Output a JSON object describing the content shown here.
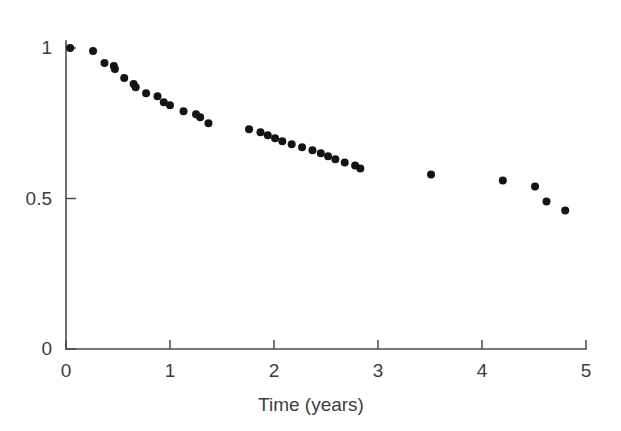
{
  "chart_data": {
    "type": "scatter",
    "title": "",
    "subtitle": "",
    "xlabel": "Time (years)",
    "ylabel": "",
    "xlim": [
      0,
      5
    ],
    "ylim": [
      0,
      1
    ],
    "xticks": [
      0,
      1,
      2,
      3,
      4,
      5
    ],
    "xticklabels": [
      "0",
      "1",
      "2",
      "3",
      "4",
      "5"
    ],
    "yticks": [
      0,
      0.5,
      1
    ],
    "yticklabels": [
      "0",
      "0.5",
      "1"
    ],
    "grid": false,
    "legend": null,
    "marker": "filled-circle",
    "marker_color": "#141414",
    "marker_size": 4,
    "series": [
      {
        "name": "survival",
        "points": [
          {
            "x": 0.04,
            "y": 1.0
          },
          {
            "x": 0.26,
            "y": 0.99
          },
          {
            "x": 0.37,
            "y": 0.95
          },
          {
            "x": 0.46,
            "y": 0.94
          },
          {
            "x": 0.47,
            "y": 0.93
          },
          {
            "x": 0.56,
            "y": 0.9
          },
          {
            "x": 0.65,
            "y": 0.88
          },
          {
            "x": 0.67,
            "y": 0.87
          },
          {
            "x": 0.77,
            "y": 0.85
          },
          {
            "x": 0.88,
            "y": 0.84
          },
          {
            "x": 0.94,
            "y": 0.82
          },
          {
            "x": 1.0,
            "y": 0.81
          },
          {
            "x": 1.13,
            "y": 0.79
          },
          {
            "x": 1.25,
            "y": 0.78
          },
          {
            "x": 1.29,
            "y": 0.77
          },
          {
            "x": 1.37,
            "y": 0.75
          },
          {
            "x": 1.76,
            "y": 0.73
          },
          {
            "x": 1.87,
            "y": 0.72
          },
          {
            "x": 1.94,
            "y": 0.71
          },
          {
            "x": 2.01,
            "y": 0.7
          },
          {
            "x": 2.08,
            "y": 0.69
          },
          {
            "x": 2.17,
            "y": 0.68
          },
          {
            "x": 2.27,
            "y": 0.67
          },
          {
            "x": 2.37,
            "y": 0.66
          },
          {
            "x": 2.45,
            "y": 0.65
          },
          {
            "x": 2.52,
            "y": 0.64
          },
          {
            "x": 2.59,
            "y": 0.63
          },
          {
            "x": 2.68,
            "y": 0.62
          },
          {
            "x": 2.78,
            "y": 0.61
          },
          {
            "x": 2.83,
            "y": 0.6
          },
          {
            "x": 3.51,
            "y": 0.58
          },
          {
            "x": 4.2,
            "y": 0.56
          },
          {
            "x": 4.51,
            "y": 0.54
          },
          {
            "x": 4.62,
            "y": 0.49
          },
          {
            "x": 4.8,
            "y": 0.46
          }
        ]
      }
    ]
  },
  "axes": {
    "x_axis_name": "time-axis",
    "y_axis_name": "survival-axis"
  }
}
